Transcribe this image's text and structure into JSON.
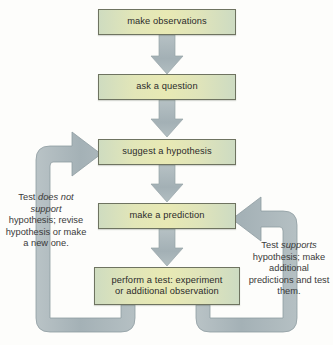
{
  "diagram": {
    "type": "flowchart",
    "canvas": {
      "width": 333,
      "height": 345
    },
    "palette": {
      "background": "#fdfdfb",
      "box_fill_green": "#cfdcc0",
      "box_fill_yellow": "#e8e9b4",
      "box_border": "#6e7360",
      "arrow_fill": "#a8b4b8",
      "arrow_stroke": "#8e9ca1",
      "text": "#2b2b2b"
    },
    "steps": [
      {
        "id": "observations",
        "label": "make observations"
      },
      {
        "id": "question",
        "label": "ask a question"
      },
      {
        "id": "hypothesis",
        "label": "suggest a hypothesis"
      },
      {
        "id": "prediction",
        "label": "make a prediction"
      },
      {
        "id": "test",
        "label_line1": "perform a test: experiment",
        "label_line2": "or additional observation"
      }
    ],
    "connectors": [
      {
        "from": "observations",
        "to": "question",
        "kind": "straight-arrow-down"
      },
      {
        "from": "question",
        "to": "hypothesis",
        "kind": "straight-arrow-down"
      },
      {
        "from": "hypothesis",
        "to": "prediction",
        "kind": "straight-arrow-down"
      },
      {
        "from": "prediction",
        "to": "test",
        "kind": "straight-arrow-down"
      },
      {
        "from": "test",
        "to": "hypothesis",
        "kind": "loop-left-arrow-right"
      },
      {
        "from": "test",
        "to": "prediction",
        "kind": "loop-right-arrow-left"
      }
    ],
    "labels": {
      "left": {
        "line1_plain": "Test ",
        "line1_italic": "does not",
        "line2_italic": "support",
        "rest": "hypothesis; revise hypothesis or make a new one."
      },
      "right": {
        "line1_plain": "Test ",
        "line1_italic": "supports",
        "rest": "hypothesis; make additional predictions and test them."
      }
    }
  }
}
